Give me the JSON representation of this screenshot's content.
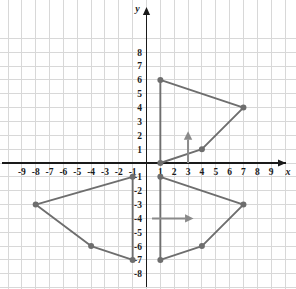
{
  "chart_data": {
    "type": "scatter",
    "title": "",
    "xlabel": "x",
    "ylabel": "y",
    "xlim": [
      -9.8,
      9.8
    ],
    "ylim": [
      -8.8,
      8.8
    ],
    "grid": true,
    "legend": "none",
    "x_ticks": [
      -9,
      -8,
      -7,
      -6,
      -5,
      -4,
      -3,
      -2,
      -1,
      1,
      2,
      3,
      4,
      5,
      6,
      7,
      8,
      9
    ],
    "y_ticks": [
      8,
      7,
      6,
      5,
      4,
      3,
      2,
      1,
      -1,
      -2,
      -3,
      -4,
      -5,
      -6,
      -7,
      -8
    ],
    "grid_step": 1,
    "series": [
      {
        "name": "upper-figure",
        "type": "polygon",
        "closed": true,
        "stroke": "#6e6e6e",
        "points": [
          [
            1,
            6
          ],
          [
            7,
            4
          ],
          [
            4,
            1
          ],
          [
            1,
            0
          ]
        ]
      },
      {
        "name": "lower-left-figure",
        "type": "polygon",
        "closed": true,
        "stroke": "#6e6e6e",
        "points": [
          [
            -1,
            -1
          ],
          [
            -8,
            -3
          ],
          [
            -4,
            -6
          ],
          [
            -1,
            -7
          ]
        ]
      },
      {
        "name": "lower-right-figure",
        "type": "polygon",
        "closed": true,
        "stroke": "#6e6e6e",
        "points": [
          [
            1,
            -1
          ],
          [
            7,
            -3
          ],
          [
            4,
            -6
          ],
          [
            1,
            -7
          ]
        ]
      }
    ],
    "annotations": [
      {
        "name": "vertical-translation-arrow",
        "type": "arrow",
        "from": [
          3,
          0
        ],
        "to": [
          3,
          2.3
        ],
        "direction": "up",
        "color": "#8a8a8a"
      },
      {
        "name": "horizontal-translation-arrow",
        "type": "arrow",
        "from": [
          0.4,
          -4
        ],
        "to": [
          3.4,
          -4
        ],
        "direction": "right",
        "color": "#8a8a8a"
      }
    ]
  },
  "axes": {
    "x_name": "x",
    "y_name": "y"
  },
  "colors": {
    "grid": "#d8d8d8",
    "axis": "#1a1a1a",
    "shape": "#6e6e6e",
    "arrow": "#8a8a8a",
    "background": "#ffffff"
  }
}
